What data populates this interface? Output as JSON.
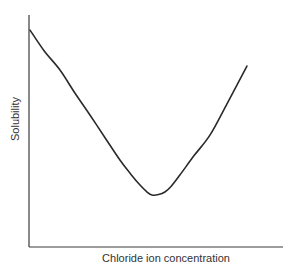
{
  "chart_data": {
    "type": "line",
    "title": "",
    "xlabel": "Chloride ion concentration",
    "ylabel": "Solubility",
    "xlim": [
      0,
      1
    ],
    "ylim": [
      0,
      1
    ],
    "grid": false,
    "legend": null,
    "ticks": {
      "x": [],
      "y": []
    },
    "series": [
      {
        "name": "Solubility vs chloride ion concentration",
        "color": "#2a2a2a",
        "x": [
          0.004,
          0.06,
          0.122,
          0.18,
          0.24,
          0.3,
          0.358,
          0.4,
          0.437,
          0.465,
          0.484,
          0.51,
          0.535,
          0.56,
          0.594,
          0.65,
          0.713,
          0.78,
          0.858
        ],
        "y": [
          0.935,
          0.845,
          0.763,
          0.665,
          0.569,
          0.47,
          0.375,
          0.315,
          0.267,
          0.237,
          0.224,
          0.226,
          0.237,
          0.262,
          0.31,
          0.394,
          0.483,
          0.618,
          0.78
        ]
      }
    ],
    "annotations": []
  }
}
